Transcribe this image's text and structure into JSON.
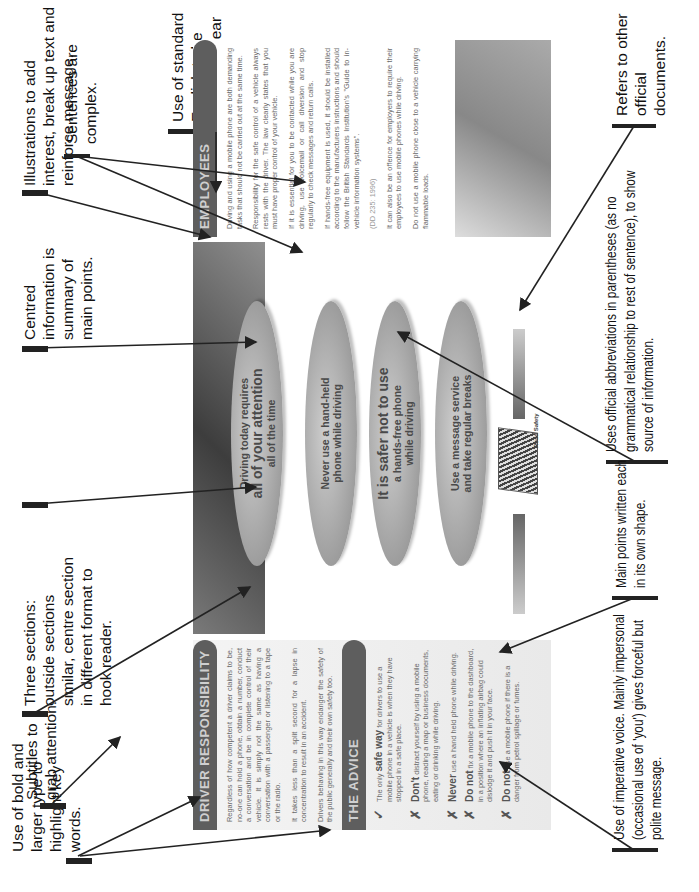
{
  "annotations": {
    "bold_type": "Use of bold and larger type to highlight key words.",
    "subtitles": "Subtitles to grab attention.",
    "three_sections": "Three sections: outside sections similar, centre section in different format to hook reader.",
    "centred_info": "Centred information is summary of main points.",
    "illustrations": "Illustrations to add interest, break up text and reinforce message.",
    "sentences": "Sentences are complex.",
    "standard_english": "Use of standard English to be exact and clear with no ambiguities.",
    "refers": "Refers to other official documents.",
    "abbreviations": "Uses official abbreviations in parentheses (as no grammatical relationship to rest of sentence), to show source of information.",
    "main_points": "Main points written each in its own shape.",
    "imperative": "Use of imperative voice. Mainly impersonal (occasional use of 'you') gives forceful but polite message."
  },
  "leaflet": {
    "left": {
      "heading": "DRIVER RESPONSIBILITY",
      "paragraphs": [
        "Regardless of how competent a driver claims to be, no-one can hold a phone, obtain a number, conduct a conversation and be in complete control of their vehicle. It is simply not the same as having a conversation with a passenger or listening to a tape or the radio.",
        "It takes less than a split second for a lapse in concentration to result in an accident.",
        "Drivers behaving in this way endanger the safety of the public generally and their own safety too."
      ],
      "advice_heading": "THE ADVICE",
      "advice": [
        {
          "mark": "✓",
          "kw": "safe way",
          "pre": "The only ",
          "post": " for drivers to use a mobile phone in a vehicle is when they have stopped in a safe place."
        },
        {
          "mark": "✗",
          "kw": "Don't",
          "pre": "",
          "post": " distract yourself by using a mobile phone, reading a map or business documents, eating or drinking while driving."
        },
        {
          "mark": "✗",
          "kw": "Never",
          "pre": "",
          "post": " use a hand held phone while driving."
        },
        {
          "mark": "✗",
          "kw": "Do not",
          "pre": "",
          "post": " fix a mobile phone to the dashboard, in a position where an inflating airbag could dislodge it and push it in your face."
        },
        {
          "mark": "✗",
          "kw": "Do not",
          "pre": "",
          "post": " use a mobile phone if there is a danger from petrol spillage or fumes."
        }
      ]
    },
    "centre": {
      "bubbles": [
        {
          "line1": "Driving today requires",
          "line2": "all of your attention",
          "line3": "all of the time"
        },
        {
          "line1": "Never use a hand-held",
          "line2": "phone while driving",
          "line3": ""
        },
        {
          "line1": "It is safer not to use",
          "line2": "a hands-free phone",
          "line3": "while driving"
        },
        {
          "line1": "Use a message service",
          "line2": "and take regular breaks",
          "line3": ""
        }
      ],
      "logo_caption": "Road Safety"
    },
    "right": {
      "heading": "EMPLOYEES",
      "paragraphs": [
        "Driving and using a mobile phone are both demanding tasks that should not be carried out at the same time.",
        "Responsibility for the safe control of a vehicle always rests with the driver. The law clearly states that you must have proper control of your vehicle.",
        "If it is essential for you to be contacted while you are driving, use voicemail or call diversion and stop regularly to check messages and return calls.",
        "If hands-free equipment is used, it should be installed according to the manufacturers instructions and should follow the British Standards Institution's \"Guide to in-vehicle information systems\"."
      ],
      "citation": "(DD 235: 1996)",
      "paragraphs2": [
        "It can also be an offence for employers to require their employees to use mobile phones while driving.",
        "Do not use a mobile phone close to a vehicle carrying flammable loads."
      ]
    }
  }
}
